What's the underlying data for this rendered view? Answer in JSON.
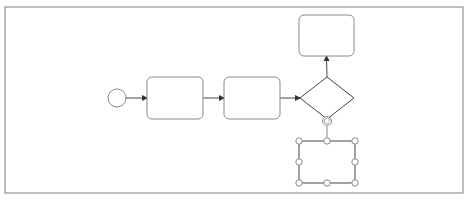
{
  "diagram": {
    "type": "bpmn-process",
    "colors": {
      "background": "#ffffff",
      "frame": "#9a9a9a",
      "shape_stroke": "#8a8a8a",
      "edge": "#444444",
      "handle_fill": "#ffffff",
      "handle_stroke": "#8a8a8a",
      "rotate_handle": "#9a9a9a"
    },
    "frame": {
      "x": 5,
      "y": 7,
      "w": 458,
      "h": 186
    },
    "nodes": [
      {
        "id": "start-event",
        "kind": "start-event",
        "label": "",
        "cx": 117,
        "cy": 98,
        "r": 9
      },
      {
        "id": "task-1",
        "kind": "task",
        "label": "",
        "x": 147,
        "y": 77,
        "w": 56,
        "h": 42
      },
      {
        "id": "task-2",
        "kind": "task",
        "label": "",
        "x": 224,
        "y": 77,
        "w": 56,
        "h": 42
      },
      {
        "id": "gateway",
        "kind": "exclusive-gateway",
        "label": "",
        "cx": 327,
        "cy": 98,
        "hw": 27,
        "hh": 21
      },
      {
        "id": "task-top",
        "kind": "task",
        "label": "",
        "x": 299,
        "y": 15,
        "w": 55,
        "h": 41
      },
      {
        "id": "task-selected",
        "kind": "task",
        "label": "",
        "x": 299,
        "y": 141,
        "w": 56,
        "h": 42,
        "selected": true
      }
    ],
    "edges": [
      {
        "from": "start-event",
        "to": "task-1"
      },
      {
        "from": "task-1",
        "to": "task-2"
      },
      {
        "from": "task-2",
        "to": "gateway"
      },
      {
        "from": "gateway",
        "to": "task-top"
      }
    ],
    "selection": {
      "target": "task-selected",
      "handles": 8,
      "rotate_handle": {
        "icon": "rotate-icon",
        "cx": 327,
        "cy": 121
      }
    }
  }
}
